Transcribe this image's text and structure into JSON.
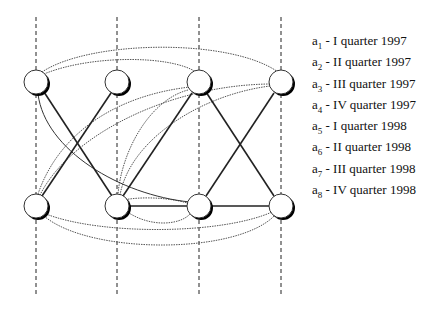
{
  "legend": {
    "items": [
      {
        "var": "a",
        "sub": "1",
        "text": " - I quarter 1997"
      },
      {
        "var": "a",
        "sub": "2",
        "text": " - II quarter 1997"
      },
      {
        "var": "a",
        "sub": "3",
        "text": " - III quarter 1997"
      },
      {
        "var": "a",
        "sub": "4",
        "text": " - IV quarter 1997"
      },
      {
        "var": "a",
        "sub": "5",
        "text": " - I quarter 1998"
      },
      {
        "var": "a",
        "sub": "6",
        "text": " - II quarter 1998"
      },
      {
        "var": "a",
        "sub": "7",
        "text": " - III quarter 1998"
      },
      {
        "var": "a",
        "sub": "8",
        "text": " - IV quarter 1998"
      }
    ]
  },
  "graph": {
    "columns_x": [
      36,
      117,
      199,
      281
    ],
    "rows_y": [
      82,
      206
    ],
    "node_radius": 12,
    "colors": {
      "solid": "#222222",
      "dotted": "#555555",
      "node_fill": "#ffffff",
      "shadow": "#000000"
    }
  }
}
